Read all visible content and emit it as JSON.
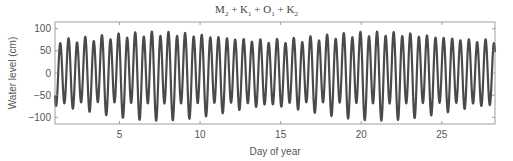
{
  "chart_data": {
    "type": "line",
    "title": "M2 + K1 + O1 + K2",
    "title_parts": [
      {
        "base": "M",
        "sub": "2"
      },
      {
        "base": "K",
        "sub": "1"
      },
      {
        "base": "O",
        "sub": "1"
      },
      {
        "base": "K",
        "sub": "2"
      }
    ],
    "xlabel": "Day of year",
    "ylabel": "Water level (cm)",
    "xlim": [
      1,
      28.3
    ],
    "ylim": [
      -115,
      115
    ],
    "xticks": [
      5,
      10,
      15,
      20,
      25
    ],
    "yticks": [
      100,
      50,
      0,
      -50,
      -100
    ],
    "ytick_labels": [
      "100",
      "50",
      "0",
      "−50",
      "−100"
    ],
    "grid": false,
    "legend": null,
    "series": [
      {
        "name": "M2 + K1 + O1 + K2 tide",
        "color": "#4a4a4a",
        "description": "Semidiurnal tide with diurnal inequality; peaks ~75-105 cm, troughs ~-80 to -98 cm",
        "constituents": [
          {
            "name": "M2",
            "period_hours": 12.4206,
            "amplitude_cm": 80,
            "phase_deg": 200
          },
          {
            "name": "K2",
            "period_hours": 11.9672,
            "amplitude_cm": 8,
            "phase_deg": 40
          },
          {
            "name": "K1",
            "period_hours": 23.9345,
            "amplitude_cm": 12,
            "phase_deg": 300
          },
          {
            "name": "O1",
            "period_hours": 25.8193,
            "amplitude_cm": 8,
            "phase_deg": 110
          }
        ]
      }
    ]
  },
  "plot_box": {
    "left": 55,
    "top": 22,
    "right": 495,
    "bottom": 124
  },
  "x_tick_positions_px": {
    "5": 120,
    "10": 200.5,
    "15": 281,
    "20": 362,
    "25": 442
  }
}
